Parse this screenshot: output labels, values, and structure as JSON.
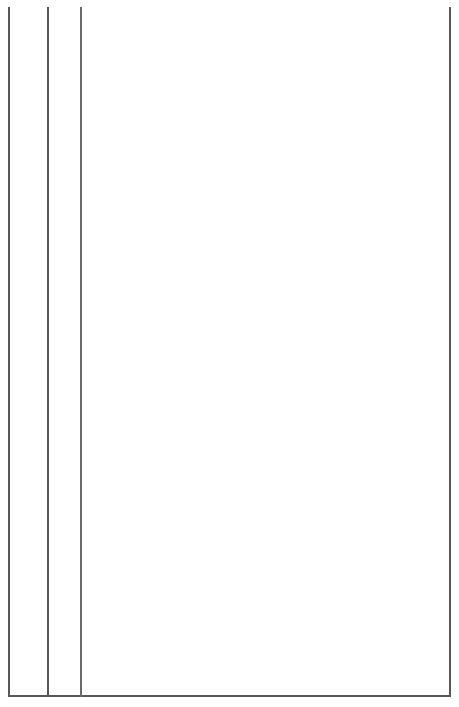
{
  "chart_data": {
    "type": "table",
    "xlabel": "Year",
    "axis": {
      "start": 1968,
      "end": 2004,
      "tick_interval": 2,
      "major_ticks": [
        "1970",
        "1980",
        "1990",
        "2000"
      ],
      "grid": false
    },
    "eras": [
      {
        "label": "Years of Great Promise",
        "start": 1968,
        "end": 1980
      },
      {
        "label": "Out of Control Times",
        "start": 1980,
        "end": 1990
      },
      {
        "label": "Finding Our Balance",
        "start": 1990,
        "end": 1999
      },
      {
        "label": "Moving Into Self-Reliance",
        "start": 1999,
        "end": 2004
      }
    ],
    "rows": [
      {
        "label": "WORLD",
        "events": [
          {
            "text": "Opening\nup of\nChina",
            "year": 1971.0,
            "tier": 0
          },
          {
            "text": "Recession\n1982",
            "year": 1979.6,
            "tier": 0
          },
          {
            "text": "Recession/\ndepression\n1982",
            "year": 1980.0,
            "tier": 1
          },
          {
            "text": "Economic\ndownturn\nprimary\nindustries\n(forestry,\nfishing)",
            "year": 1984.6,
            "tier": 0
          },
          {
            "text": "Deconstruction\nof communist\nworld",
            "year": 1989.6,
            "tier": 0
          },
          {
            "text": "Lumber prices\ngo up, US\nfloods 1992",
            "year": 1990.6,
            "tier": 1
          },
          {
            "text": "Fiscal Restraint\n(gov't downsizing)\n1990-1995",
            "year": 1994.8,
            "tier": 0
          },
          {
            "text": "NAFTA\nincreased\naccess to\nlargest of\nTRIAD",
            "year": 1999.9,
            "tier": 0
          }
        ]
      },
      {
        "label": "PROVINCE",
        "events": [
          {
            "text": "Before 1970\ntotally\ndominant\nroles of",
            "year": 1968.4,
            "tier": 0
          },
          {
            "text": "High school\nregionalization\n1975",
            "year": 1972.7,
            "tier": 0
          },
          {
            "text": "Closure of many\nresource-based\nindustries 1983",
            "year": 1982.0,
            "tier": 0
          },
          {
            "text": "2nd school system did not change to\nreflect role of business 1980-1990",
            "year": 1982.4,
            "tier": 1
          },
          {
            "text": "MLA\nelected\npremier\n1987",
            "year": 1987.3,
            "tier": 0
          },
          {
            "text": "Knowledge-\nbased\nprogrammes,\ncommunity\ncollege\nexpansion",
            "year": 1990.9,
            "tier": 0
          },
          {
            "text": "Forest sector\nrejuvenated 1993",
            "year": 1991.6,
            "tier": 1
          },
          {
            "text": "Siskin Report,\neconomic strategies",
            "year": 1994.4,
            "tier": 1
          },
          {
            "text": "Regional\nhospital,\nhighway",
            "year": 1998.1,
            "tier": 0
          },
          {
            "text": "Free trade,\nclosing of\nair base",
            "year": 1998.4,
            "tier": 1
          },
          {
            "text": "Business\ncoming to\nprovince",
            "year": 2001.0,
            "tier": 1
          }
        ]
      },
      {
        "label": "REGION",
        "events": [
          {
            "text": "Regional\ninitiatives,\nRiverfront,\nTourism\n1970",
            "year": 1968.4,
            "tier": 1
          },
          {
            "text": "New mall",
            "year": 1969.4,
            "tier": 0
          },
          {
            "text": "River\ndredging,\nport\ndevelopment\n1975",
            "year": 1970.7,
            "tier": 0
          },
          {
            "text": "Strong\nsporting\ntradition",
            "year": 1975.8,
            "tier": 0
          },
          {
            "text": "Mines\nclosure\n1978",
            "year": 1976.2,
            "tier": 1
          },
          {
            "text": "Port\ndevelopment,\nMLA elected",
            "year": 1978.6,
            "tier": 0
          },
          {
            "text": "Threat of\nbase culture\n1980",
            "year": 1979.4,
            "tier": 1
          },
          {
            "text": "Mine closure,\nwaterboard\nclosure 1985",
            "year": 1983.3,
            "tier": 0
          },
          {
            "text": "Technology\nchanges\n1988",
            "year": 1984.6,
            "tier": 1
          },
          {
            "text": "Plant\nexpansion\n1990",
            "year": 1988.2,
            "tier": 0
          },
          {
            "text": "Plant expansion\n(new machines)",
            "year": 1988.8,
            "tier": 1
          },
          {
            "text": "$1 Billion spent at plant",
            "year": 1990.3,
            "tier": 2
          },
          {
            "text": "Canadian\nsenior\nhockey\nchamps",
            "year": 1991.6,
            "tier": 0
          },
          {
            "text": "Senior\nbaseball\nchamps",
            "year": 1995.6,
            "tier": 0
          },
          {
            "text": "Closure of forces base 1995",
            "year": 1992.2,
            "tier": 1
          },
          {
            "text": "Base closure announced 1990-1995",
            "year": 1992.6,
            "tier": 2
          },
          {
            "text": "Plant re-investment\nof $1.3 billion\nin value-added\nforest product",
            "year": 1993.4,
            "tier": 3
          },
          {
            "text": "Creation of new city",
            "year": 1996.9,
            "tier": 1
          },
          {
            "text": "Amalgamation of city 1994",
            "year": 1997.6,
            "tier": 2
          },
          {
            "text": "Amalgamation",
            "year": 1998.2,
            "tier": 3
          }
        ]
      }
    ],
    "markers": [
      {
        "kind": "dot",
        "row": "PROVINCE",
        "year": 1986.8,
        "tier": 0,
        "label": "MLA elected premier 1987"
      },
      {
        "kind": "dot",
        "row": "REGION",
        "year": 1976.0,
        "tier": 1,
        "label": "Mines closure 1978"
      },
      {
        "kind": "dot",
        "row": "REGION",
        "year": 1997.2,
        "tier": 2,
        "label": "Amalgamation of city 1994"
      },
      {
        "kind": "chevron",
        "row": "PROVINCE",
        "year": 1981.5,
        "tier": 0,
        "label": "Closure of many resource-based industries 1983"
      },
      {
        "kind": "chevron",
        "row": "REGION",
        "year": 1989.4,
        "tier": 1,
        "label": "Plant expansion (new machines)"
      }
    ],
    "colors": {
      "ink": "#1a1a1a",
      "rule": "#58585a",
      "thin_rule": "#6a6a6c",
      "marker": "#111111",
      "background": "#ffffff"
    }
  }
}
